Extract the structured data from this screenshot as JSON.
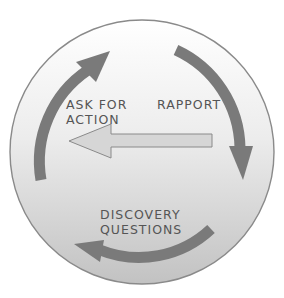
{
  "diagram": {
    "title": "",
    "nodes": [
      {
        "id": "rapport",
        "label": "RAPPORT"
      },
      {
        "id": "discovery",
        "label_line1": "DISCOVERY",
        "label_line2": "QUESTIONS"
      },
      {
        "id": "ask",
        "label_line1": "ASK FOR",
        "label_line2": "ACTION"
      }
    ],
    "edges": [
      {
        "from": "ask",
        "to": "rapport",
        "style": "curved-dark-arrow"
      },
      {
        "from": "rapport",
        "to": "discovery",
        "style": "curved-dark-arrow"
      },
      {
        "from": "discovery",
        "to": "ask",
        "style": "curved-dark-arrow"
      },
      {
        "from": "rapport",
        "to": "ask",
        "style": "straight-light-arrow"
      }
    ],
    "colors": {
      "circle_top": "#ffffff",
      "circle_bottom": "#c4c4c4",
      "circle_border": "#8a8a8a",
      "cycle_arrow": "#7a7a7a",
      "shortcut_arrow_fill": "#d6d6d6",
      "shortcut_arrow_stroke": "#8a8a8a",
      "text": "#555555"
    }
  }
}
